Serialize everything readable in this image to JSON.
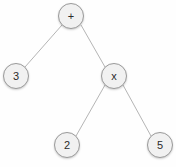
{
  "diagram": {
    "type": "binary-expression-tree",
    "title": "",
    "canvas": {
      "width": 176,
      "height": 167,
      "background": "#fefefe"
    },
    "style": {
      "node_fill": "#f1f1f1",
      "node_stroke": "#9a9a9a",
      "node_radius": 13,
      "label_color": "#2b2b2b",
      "edge_color": "#b5b5b5",
      "edge_width": 1
    },
    "nodes": [
      {
        "id": "root",
        "label": "+",
        "kind": "operator",
        "x": 71,
        "y": 16
      },
      {
        "id": "left",
        "label": "3",
        "kind": "operand",
        "x": 16,
        "y": 76
      },
      {
        "id": "mul",
        "label": "x",
        "kind": "operator",
        "x": 114,
        "y": 76
      },
      {
        "id": "mul-l",
        "label": "2",
        "kind": "operand",
        "x": 67,
        "y": 145
      },
      {
        "id": "mul-r",
        "label": "5",
        "kind": "operand",
        "x": 160,
        "y": 145
      }
    ],
    "edges": [
      {
        "id": "edge-root-left",
        "from": "root",
        "to": "left",
        "x1": 62,
        "y1": 25,
        "x2": 25,
        "y2": 67
      },
      {
        "id": "edge-root-mul",
        "from": "root",
        "to": "mul",
        "x1": 81,
        "y1": 25,
        "x2": 105,
        "y2": 67
      },
      {
        "id": "edge-mul-left",
        "from": "mul",
        "to": "mul-l",
        "x1": 105,
        "y1": 85,
        "x2": 76,
        "y2": 136
      },
      {
        "id": "edge-mul-right",
        "from": "mul",
        "to": "mul-r",
        "x1": 123,
        "y1": 85,
        "x2": 151,
        "y2": 136
      }
    ]
  }
}
